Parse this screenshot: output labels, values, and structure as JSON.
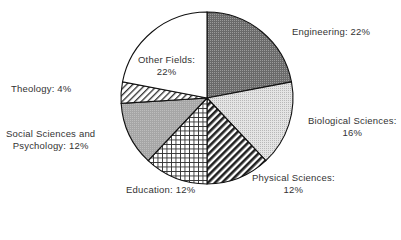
{
  "chart_data": {
    "type": "pie",
    "title": "",
    "categories": [
      "Engineering",
      "Biological Sciences",
      "Physical Sciences",
      "Education",
      "Social Sciences and Psychology",
      "Theology",
      "Other Fields"
    ],
    "values": [
      22,
      16,
      12,
      12,
      12,
      4,
      22
    ],
    "unit": "%",
    "start_angle": "12 o'clock",
    "direction": "clockwise",
    "fills": [
      "dark-dotted",
      "light-dotted",
      "bold-diagonal-stripes",
      "crosshatch-grid",
      "medium-gray",
      "diagonal-hatch",
      "white"
    ],
    "legend": "none (direct labels)"
  },
  "labels": {
    "engineering": [
      "Engineering: 22%"
    ],
    "biological": [
      "Biological Sciences:",
      "16%"
    ],
    "physical": [
      "Physical Sciences:",
      "12%"
    ],
    "education": [
      "Education: 12%"
    ],
    "social": [
      "Social Sciences and",
      "Psychology: 12%"
    ],
    "theology": [
      "Theology: 4%"
    ],
    "other": [
      "Other Fields:",
      "22%"
    ]
  }
}
